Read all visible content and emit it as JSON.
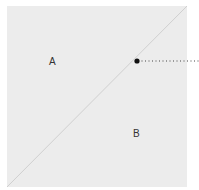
{
  "diagram": {
    "regions": [
      {
        "id": "A",
        "label": "A"
      },
      {
        "id": "B",
        "label": "B"
      }
    ],
    "colors": {
      "square_fill": "#ececec",
      "diagonal": "#d0d0d0",
      "marker": "#111111",
      "leader": "#444444"
    }
  }
}
